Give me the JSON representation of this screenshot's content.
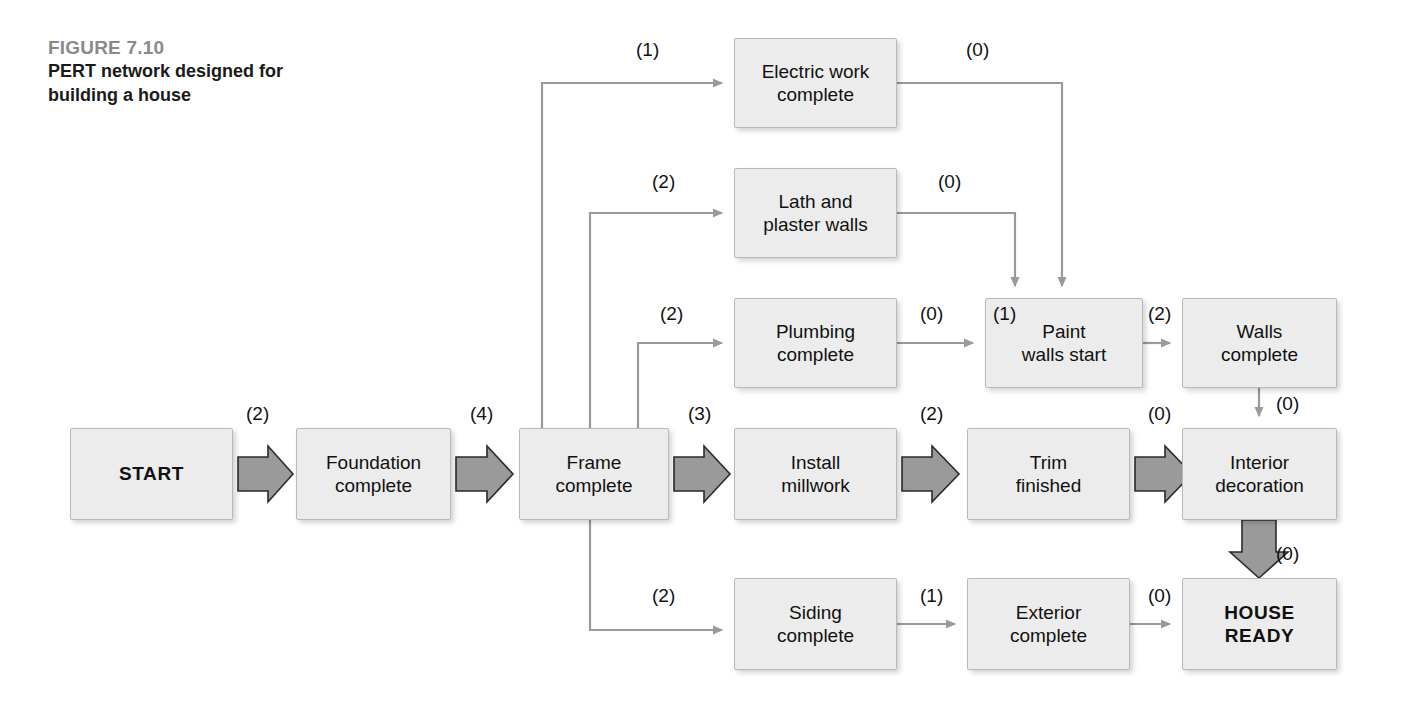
{
  "figure": {
    "number": "FIGURE 7.10",
    "title_line1": "PERT network designed for",
    "title_line2": "building a house"
  },
  "colors": {
    "node_fill": "#ececec",
    "node_border": "#b9b9b9",
    "thin_arrow": "#9a9a9a",
    "thick_arrow_fill": "#9a9a9a",
    "thick_arrow_stroke": "#2b2b2b",
    "text": "#111111",
    "fig_number": "#8a8a8a",
    "background": "#ffffff"
  },
  "chart_data": {
    "type": "diagram",
    "title": "PERT network designed for building a house",
    "nodes": [
      {
        "id": "start",
        "label": "START",
        "bold": true,
        "x": 70,
        "y": 428,
        "w": 163,
        "h": 92
      },
      {
        "id": "foundation",
        "label": "Foundation\ncomplete",
        "bold": false,
        "x": 296,
        "y": 428,
        "w": 155,
        "h": 92
      },
      {
        "id": "frame",
        "label": "Frame\ncomplete",
        "bold": false,
        "x": 519,
        "y": 428,
        "w": 150,
        "h": 92
      },
      {
        "id": "electric",
        "label": "Electric work\ncomplete",
        "bold": false,
        "x": 734,
        "y": 38,
        "w": 163,
        "h": 90
      },
      {
        "id": "lath",
        "label": "Lath and\nplaster walls",
        "bold": false,
        "x": 734,
        "y": 168,
        "w": 163,
        "h": 90
      },
      {
        "id": "plumbing",
        "label": "Plumbing\ncomplete",
        "bold": false,
        "x": 734,
        "y": 298,
        "w": 163,
        "h": 90
      },
      {
        "id": "millwork",
        "label": "Install\nmillwork",
        "bold": false,
        "x": 734,
        "y": 428,
        "w": 163,
        "h": 92
      },
      {
        "id": "siding",
        "label": "Siding\ncomplete",
        "bold": false,
        "x": 734,
        "y": 578,
        "w": 163,
        "h": 92
      },
      {
        "id": "paintstart",
        "label": "Paint\nwalls start",
        "bold": false,
        "x": 985,
        "y": 298,
        "w": 158,
        "h": 90
      },
      {
        "id": "trim",
        "label": "Trim\nfinished",
        "bold": false,
        "x": 967,
        "y": 428,
        "w": 163,
        "h": 92
      },
      {
        "id": "exterior",
        "label": "Exterior\ncomplete",
        "bold": false,
        "x": 967,
        "y": 578,
        "w": 163,
        "h": 92
      },
      {
        "id": "walls",
        "label": "Walls\ncomplete",
        "bold": false,
        "x": 1182,
        "y": 298,
        "w": 155,
        "h": 90
      },
      {
        "id": "interior",
        "label": "Interior\ndecoration",
        "bold": false,
        "x": 1182,
        "y": 428,
        "w": 155,
        "h": 92
      },
      {
        "id": "houseready",
        "label": "HOUSE\nREADY",
        "bold": true,
        "x": 1182,
        "y": 578,
        "w": 155,
        "h": 92
      }
    ],
    "edges": [
      {
        "from": "start",
        "to": "foundation",
        "weight": "(2)",
        "critical": true
      },
      {
        "from": "foundation",
        "to": "frame",
        "weight": "(4)",
        "critical": true
      },
      {
        "from": "frame",
        "to": "electric",
        "weight": "(1)",
        "critical": false
      },
      {
        "from": "frame",
        "to": "lath",
        "weight": "(2)",
        "critical": false
      },
      {
        "from": "frame",
        "to": "plumbing",
        "weight": "(2)",
        "critical": false
      },
      {
        "from": "frame",
        "to": "millwork",
        "weight": "(3)",
        "critical": true
      },
      {
        "from": "frame",
        "to": "siding",
        "weight": "(2)",
        "critical": false
      },
      {
        "from": "electric",
        "to": "paintstart",
        "weight": "(0)",
        "critical": false
      },
      {
        "from": "lath",
        "to": "paintstart",
        "weight": "(0)",
        "critical": false
      },
      {
        "from": "plumbing",
        "to": "paintstart",
        "weight": "(0)",
        "critical": false
      },
      {
        "from": "paintstart",
        "to": "walls",
        "weight": "(2)",
        "critical": false
      },
      {
        "from": "millwork",
        "to": "trim",
        "weight": "(2)",
        "critical": true
      },
      {
        "from": "trim",
        "to": "interior",
        "weight": "(0)",
        "critical": true
      },
      {
        "from": "walls",
        "to": "interior",
        "weight": "(0)",
        "critical": false
      },
      {
        "from": "interior",
        "to": "houseready",
        "weight": "(0)",
        "critical": true
      },
      {
        "from": "siding",
        "to": "exterior",
        "weight": "(1)",
        "critical": false
      },
      {
        "from": "exterior",
        "to": "houseready",
        "weight": "(0)",
        "critical": false
      }
    ],
    "node_inner_labels": [
      {
        "node": "paintstart",
        "text": "(1)",
        "position": "top-left"
      }
    ],
    "edge_label_positions": [
      {
        "id": "lbl_start_foundation",
        "text": "(2)",
        "x": 246,
        "y": 404
      },
      {
        "id": "lbl_foundation_frame",
        "text": "(4)",
        "x": 470,
        "y": 404
      },
      {
        "id": "lbl_frame_electric",
        "text": "(1)",
        "x": 636,
        "y": 40
      },
      {
        "id": "lbl_electric_paint",
        "text": "(0)",
        "x": 966,
        "y": 40
      },
      {
        "id": "lbl_frame_lath",
        "text": "(2)",
        "x": 652,
        "y": 172
      },
      {
        "id": "lbl_lath_paint",
        "text": "(0)",
        "x": 938,
        "y": 172
      },
      {
        "id": "lbl_frame_plumbing",
        "text": "(2)",
        "x": 660,
        "y": 304
      },
      {
        "id": "lbl_plumbing_paint",
        "text": "(0)",
        "x": 920,
        "y": 304
      },
      {
        "id": "lbl_paint_inner",
        "text": "(1)",
        "x": 993,
        "y": 304
      },
      {
        "id": "lbl_paint_walls",
        "text": "(2)",
        "x": 1148,
        "y": 304
      },
      {
        "id": "lbl_frame_millwork",
        "text": "(3)",
        "x": 688,
        "y": 404
      },
      {
        "id": "lbl_millwork_trim",
        "text": "(2)",
        "x": 920,
        "y": 404
      },
      {
        "id": "lbl_trim_interior",
        "text": "(0)",
        "x": 1148,
        "y": 404
      },
      {
        "id": "lbl_walls_interior",
        "text": "(0)",
        "x": 1276,
        "y": 394
      },
      {
        "id": "lbl_interior_house",
        "text": "(0)",
        "x": 1276,
        "y": 544
      },
      {
        "id": "lbl_frame_siding",
        "text": "(2)",
        "x": 652,
        "y": 586
      },
      {
        "id": "lbl_siding_exterior",
        "text": "(1)",
        "x": 920,
        "y": 586
      },
      {
        "id": "lbl_exterior_house",
        "text": "(0)",
        "x": 1148,
        "y": 586
      }
    ]
  }
}
